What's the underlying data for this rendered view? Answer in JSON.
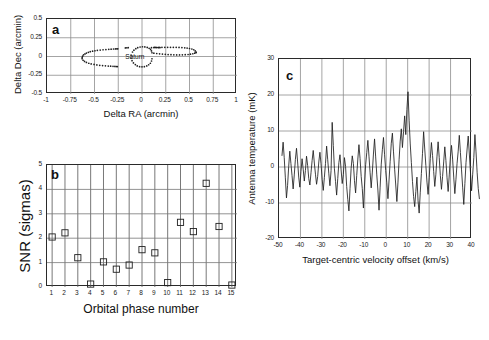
{
  "figure": {
    "background": "#ffffff",
    "axis_color": "#2a2a2a",
    "grid_color": "#8d8d8d",
    "data_color": "#1f1f1f"
  },
  "panel_a": {
    "letter": "a",
    "xlabel": "Delta RA (arcmin)",
    "ylabel": "Delta Dec (arcmin)",
    "xticks": [
      "-1",
      "-0.75",
      "-0.5",
      "-0.25",
      "0",
      "0.25",
      "0.5",
      "0.75",
      "1"
    ],
    "yticks": [
      "0.5",
      "0.25",
      "0",
      "-0.25",
      "-0.5"
    ],
    "annotation": "Saturn"
  },
  "panel_b": {
    "letter": "b",
    "xlabel": "Orbital phase number",
    "ylabel": "SNR (sigmas)",
    "xticks": [
      "1",
      "2",
      "3",
      "4",
      "5",
      "6",
      "7",
      "8",
      "9",
      "10",
      "11",
      "12",
      "13",
      "14",
      "15"
    ],
    "yticks": [
      "5",
      "4",
      "3",
      "2",
      "1",
      "0"
    ]
  },
  "panel_c": {
    "letter": "c",
    "xlabel": "Target-centric velocity offset (km/s)",
    "ylabel": "Antenna temperature (mK)",
    "xticks": [
      "-50",
      "-40",
      "-30",
      "-20",
      "-10",
      "0",
      "10",
      "20",
      "30",
      "40"
    ],
    "yticks": [
      "30",
      "20",
      "10",
      "0",
      "-10",
      "-20"
    ]
  },
  "chart_data": [
    {
      "type": "scatter",
      "panel": "a",
      "title": "Saturn disk and rings scan positions",
      "xlabel": "Delta RA (arcmin)",
      "ylabel": "Delta Dec (arcmin)",
      "xlim": [
        -1,
        1
      ],
      "ylim": [
        -0.5,
        0.5
      ],
      "xticks": [
        -1,
        -0.75,
        -0.5,
        -0.25,
        0,
        0.25,
        0.5,
        0.75,
        1
      ],
      "yticks": [
        -0.5,
        -0.25,
        0,
        0.25,
        0.5
      ],
      "grid": true,
      "legend": "none",
      "annotations": [
        {
          "text": "Saturn",
          "x": -0.06,
          "y": -0.02
        }
      ],
      "series": [
        {
          "name": "west-ring-ansa",
          "marker": "dot",
          "x": [
            -0.63,
            -0.625,
            -0.615,
            -0.6,
            -0.585,
            -0.565,
            -0.545,
            -0.52,
            -0.495,
            -0.47,
            -0.44,
            -0.41,
            -0.38,
            -0.35,
            -0.325,
            -0.3,
            -0.28,
            -0.265,
            -0.255,
            -0.63,
            -0.62,
            -0.605,
            -0.585,
            -0.56,
            -0.535,
            -0.505,
            -0.475,
            -0.445,
            -0.415,
            -0.385,
            -0.355,
            -0.33,
            -0.305,
            -0.285,
            -0.27,
            -0.26
          ],
          "y": [
            -0.015,
            0.005,
            0.022,
            0.035,
            0.046,
            0.056,
            0.064,
            0.071,
            0.077,
            0.082,
            0.086,
            0.09,
            0.093,
            0.096,
            0.098,
            0.1,
            0.101,
            0.102,
            0.103,
            -0.03,
            -0.05,
            -0.066,
            -0.079,
            -0.09,
            -0.099,
            -0.106,
            -0.112,
            -0.117,
            -0.121,
            -0.124,
            -0.127,
            -0.129,
            -0.131,
            -0.132,
            -0.133,
            -0.134
          ]
        },
        {
          "name": "east-ring-ansa",
          "marker": "dot",
          "x": [
            0.1,
            0.125,
            0.15,
            0.18,
            0.21,
            0.24,
            0.27,
            0.3,
            0.33,
            0.36,
            0.39,
            0.42,
            0.45,
            0.475,
            0.5,
            0.525,
            0.545,
            0.56,
            0.57,
            0.125,
            0.155,
            0.185,
            0.215,
            0.245,
            0.275,
            0.305,
            0.335,
            0.365,
            0.395,
            0.425,
            0.455,
            0.485,
            0.51,
            0.535,
            0.555,
            0.57
          ],
          "y": [
            0.118,
            0.119,
            0.12,
            0.121,
            0.122,
            0.122,
            0.123,
            0.123,
            0.123,
            0.122,
            0.121,
            0.119,
            0.116,
            0.112,
            0.107,
            0.1,
            0.09,
            0.075,
            0.055,
            0.045,
            0.04,
            0.036,
            0.032,
            0.029,
            0.026,
            0.024,
            0.022,
            0.021,
            0.021,
            0.022,
            0.024,
            0.027,
            0.031,
            0.037,
            0.045,
            0.055
          ]
        },
        {
          "name": "saturn-disk",
          "marker": "dot",
          "x": [
            -0.115,
            -0.1,
            -0.085,
            -0.065,
            -0.045,
            -0.02,
            0.005,
            0.03,
            0.055,
            0.075,
            0.09,
            0.1,
            0.105,
            -0.115,
            -0.105,
            -0.09,
            -0.07,
            -0.05,
            -0.025,
            0.0,
            0.025,
            0.05,
            0.07,
            0.088,
            0.1,
            0.105
          ],
          "y": [
            0.02,
            0.06,
            0.085,
            0.105,
            0.118,
            0.127,
            0.13,
            0.128,
            0.121,
            0.11,
            0.095,
            0.075,
            0.05,
            -0.02,
            -0.055,
            -0.085,
            -0.108,
            -0.125,
            -0.135,
            -0.138,
            -0.135,
            -0.125,
            -0.11,
            -0.09,
            -0.06,
            -0.03
          ]
        },
        {
          "name": "inner-gap-points",
          "marker": "dot",
          "x": [
            -0.175,
            -0.16,
            -0.145,
            0.13,
            0.145,
            0.16,
            0.175,
            0.19
          ],
          "y": [
            0.115,
            0.117,
            0.118,
            0.122,
            0.121,
            0.12,
            0.119,
            0.119
          ]
        }
      ]
    },
    {
      "type": "scatter",
      "panel": "b",
      "title": "Detection significance per orbital phase",
      "xlabel": "Orbital phase number",
      "ylabel": "SNR (sigmas)",
      "xlim": [
        0.6,
        15.4
      ],
      "ylim": [
        0,
        5
      ],
      "xticks": [
        1,
        2,
        3,
        4,
        5,
        6,
        7,
        8,
        9,
        10,
        11,
        12,
        13,
        14,
        15
      ],
      "yticks": [
        0,
        1,
        2,
        3,
        4,
        5
      ],
      "grid": true,
      "marker": "open-square",
      "legend": "none",
      "categories": [
        1,
        2,
        3,
        4,
        5,
        6,
        7,
        8,
        9,
        10,
        11,
        12,
        13,
        14,
        15
      ],
      "values": [
        2.05,
        2.22,
        1.2,
        0.12,
        1.03,
        0.73,
        0.9,
        1.53,
        1.4,
        0.18,
        2.65,
        2.27,
        4.25,
        2.48,
        0.08
      ]
    },
    {
      "type": "line",
      "panel": "c",
      "title": "Stacked spectrum",
      "xlabel": "Target-centric velocity offset (km/s)",
      "ylabel": "Antenna temperature (mK)",
      "xlim": [
        -50,
        40
      ],
      "ylim": [
        -20,
        30
      ],
      "xticks": [
        -50,
        -40,
        -30,
        -20,
        -10,
        0,
        10,
        20,
        30,
        40
      ],
      "yticks": [
        -20,
        -10,
        0,
        10,
        20,
        30
      ],
      "grid": true,
      "legend": "none",
      "x_start": -48.6,
      "x_step": 0.52,
      "peak": {
        "x": 1.2,
        "y": 20.9
      },
      "values": [
        3.2,
        6.9,
        2.6,
        -3.0,
        -8.6,
        -5.1,
        0.2,
        4.4,
        1.0,
        -2.4,
        -6.1,
        -2.2,
        2.1,
        5.2,
        1.4,
        -2.8,
        -5.6,
        -1.2,
        2.3,
        -0.6,
        -3.9,
        -1.0,
        3.0,
        0.4,
        -3.2,
        -5.0,
        -1.6,
        1.8,
        4.6,
        1.1,
        -2.0,
        -4.8,
        -2.6,
        1.4,
        4.1,
        0.9,
        -3.4,
        -6.5,
        -2.9,
        1.0,
        5.8,
        2.0,
        -1.9,
        -5.2,
        -1.0,
        12.4,
        6.0,
        -0.5,
        -4.0,
        -7.8,
        -3.2,
        1.2,
        3.4,
        -0.8,
        -4.6,
        -2.1,
        2.6,
        0.2,
        -5.4,
        -9.0,
        -12.2,
        -6.0,
        -0.4,
        3.1,
        1.0,
        -3.8,
        -7.2,
        -2.4,
        2.2,
        6.2,
        2.4,
        -2.6,
        -6.0,
        -11.4,
        -5.0,
        0.6,
        4.0,
        7.4,
        3.0,
        -1.6,
        -5.8,
        -1.4,
        3.6,
        7.8,
        2.8,
        -2.2,
        -6.4,
        -12.0,
        -5.6,
        0.8,
        4.8,
        8.2,
        3.4,
        -1.0,
        -4.4,
        -8.8,
        -3.6,
        1.6,
        6.6,
        9.4,
        4.2,
        -0.6,
        -5.0,
        -9.6,
        -4.2,
        2.0,
        7.2,
        10.6,
        5.4,
        9.8,
        14.2,
        9.0,
        16.0,
        20.9,
        13.0,
        6.4,
        1.2,
        -4.0,
        -8.2,
        -11.0,
        -6.8,
        -2.8,
        -9.4,
        -12.8,
        -7.0,
        -1.8,
        3.8,
        9.8,
        5.0,
        0.4,
        -4.2,
        -7.6,
        -3.0,
        2.4,
        6.8,
        3.2,
        -1.2,
        -5.4,
        -2.0,
        3.0,
        7.0,
        2.6,
        -2.4,
        -6.2,
        -2.6,
        1.4,
        5.6,
        1.8,
        -3.0,
        -6.8,
        -2.2,
        2.8,
        6.0,
        2.2,
        -2.8,
        -7.4,
        -3.4,
        1.0,
        4.4,
        8.8,
        4.0,
        -0.8,
        -5.6,
        -10.4,
        -4.6,
        1.2,
        5.0,
        8.6,
        3.6,
        -1.4,
        -6.6,
        -2.0,
        2.6,
        9.0,
        4.2,
        -1.6,
        -6.0,
        -8.8
      ]
    }
  ]
}
